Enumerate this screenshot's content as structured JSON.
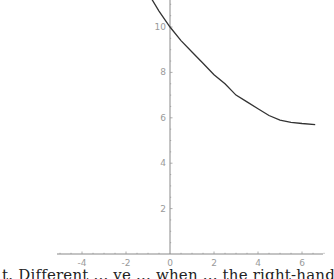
{
  "chart_data": {
    "type": "line",
    "title": "",
    "xlabel": "",
    "ylabel": "",
    "xlim": [
      -5.2,
      7
    ],
    "ylim": [
      0,
      11.2
    ],
    "grid": false,
    "x_ticks": [
      -4,
      -2,
      0,
      2,
      4,
      6
    ],
    "y_ticks": [
      2,
      4,
      6,
      8,
      10
    ],
    "x_tick_labels": [
      "-4",
      "-2",
      "0",
      "2",
      "4",
      "6"
    ],
    "y_tick_labels": [
      "2",
      "4",
      "6",
      "8",
      "10"
    ],
    "series": [
      {
        "name": "curve",
        "x": [
          -1.0,
          -0.5,
          0,
          0.5,
          1,
          1.5,
          2,
          2.5,
          3,
          3.5,
          4,
          4.5,
          5,
          5.5,
          6,
          6.6
        ],
        "y": [
          11.5,
          10.7,
          10.0,
          9.4,
          8.9,
          8.4,
          7.9,
          7.5,
          7.0,
          6.7,
          6.4,
          6.1,
          5.9,
          5.8,
          5.75,
          5.7
        ]
      }
    ]
  },
  "caption": "t. Different ... ve ... when ... the right-hand ... Note that it ..."
}
